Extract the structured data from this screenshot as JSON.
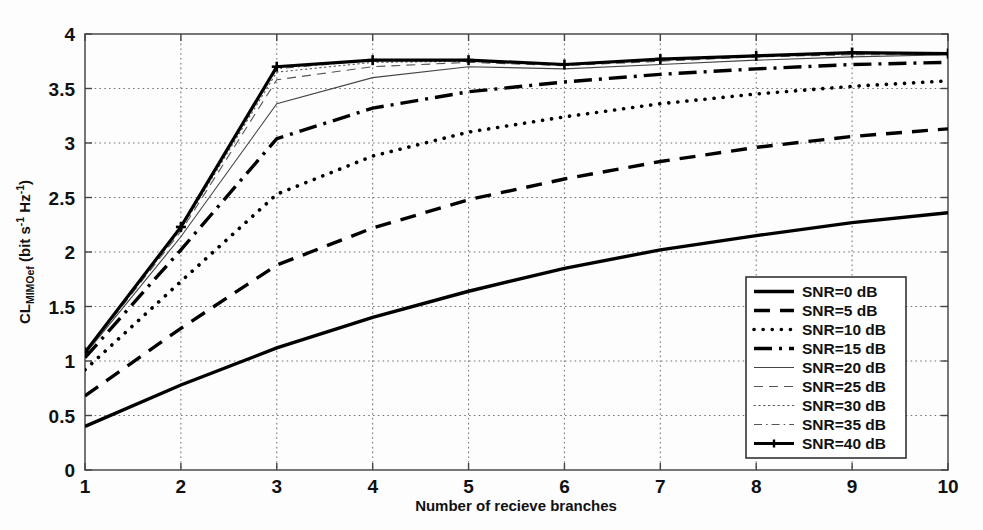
{
  "chart_data": {
    "type": "line",
    "title": "",
    "xlabel": "Number of recieve branches",
    "ylabel": "CL_MIMOef (bit s^-1 Hz^-1)",
    "ylabel_parts": {
      "main1": "CL",
      "sub1": "MIMOef",
      "main2": " (bit s",
      "sup1": "-1",
      "main3": " Hz",
      "sup2": "-1",
      "main4": ")"
    },
    "x": [
      1,
      2,
      3,
      4,
      5,
      6,
      7,
      8,
      9,
      10
    ],
    "xlim": [
      1,
      10
    ],
    "ylim": [
      0,
      4
    ],
    "xticks": [
      "1",
      "2",
      "3",
      "4",
      "5",
      "6",
      "7",
      "8",
      "9",
      "10"
    ],
    "yticks": [
      "0",
      "0.5",
      "1",
      "1.5",
      "2",
      "2.5",
      "3",
      "3.5",
      "4"
    ],
    "grid": true,
    "grid_style": "dotted",
    "legend_position": "lower-right",
    "series": [
      {
        "name": "SNR=0 dB",
        "label": "SNR=0 dB",
        "style": "solid",
        "width": 3.4,
        "marker": "none",
        "color": "#000000",
        "values": [
          0.4,
          0.78,
          1.12,
          1.4,
          1.64,
          1.85,
          2.02,
          2.15,
          2.27,
          2.36
        ]
      },
      {
        "name": "SNR=5 dB",
        "label": "SNR=5 dB",
        "style": "dashed",
        "width": 3.4,
        "marker": "none",
        "color": "#000000",
        "values": [
          0.68,
          1.3,
          1.88,
          2.22,
          2.48,
          2.67,
          2.83,
          2.96,
          3.06,
          3.13
        ]
      },
      {
        "name": "SNR=10 dB",
        "label": "SNR=10 dB",
        "style": "dotted",
        "width": 3.6,
        "marker": "none",
        "color": "#000000",
        "values": [
          0.92,
          1.73,
          2.53,
          2.88,
          3.1,
          3.24,
          3.36,
          3.45,
          3.52,
          3.57
        ]
      },
      {
        "name": "SNR=15 dB",
        "label": "SNR=15 dB",
        "style": "dashdot",
        "width": 3.4,
        "marker": "none",
        "color": "#000000",
        "values": [
          1.03,
          2.02,
          3.04,
          3.32,
          3.47,
          3.56,
          3.63,
          3.68,
          3.72,
          3.74
        ]
      },
      {
        "name": "SNR=20 dB",
        "label": "SNR=20 dB",
        "style": "solid",
        "width": 1.1,
        "marker": "none",
        "color": "#444444",
        "values": [
          1.06,
          2.14,
          3.36,
          3.6,
          3.7,
          3.68,
          3.72,
          3.76,
          3.79,
          3.81
        ]
      },
      {
        "name": "SNR=25 dB",
        "label": "SNR=25 dB",
        "style": "dashed-thin",
        "width": 1.1,
        "marker": "none",
        "color": "#555555",
        "values": [
          1.07,
          2.19,
          3.58,
          3.7,
          3.74,
          3.71,
          3.75,
          3.79,
          3.81,
          3.81
        ]
      },
      {
        "name": "SNR=30 dB",
        "label": "SNR=30 dB",
        "style": "dotted-thin",
        "width": 1.1,
        "marker": "none",
        "color": "#555555",
        "values": [
          1.07,
          2.21,
          3.65,
          3.74,
          3.75,
          3.72,
          3.76,
          3.8,
          3.82,
          3.82
        ]
      },
      {
        "name": "SNR=35 dB",
        "label": "SNR=35 dB",
        "style": "dashdot-thin",
        "width": 1.1,
        "marker": "none",
        "color": "#555555",
        "values": [
          1.08,
          2.22,
          3.68,
          3.76,
          3.76,
          3.72,
          3.77,
          3.8,
          3.82,
          3.82
        ]
      },
      {
        "name": "SNR=40 dB",
        "label": "SNR=40 dB",
        "style": "solid-marker",
        "width": 3.2,
        "marker": "plus",
        "color": "#000000",
        "values": [
          1.08,
          2.23,
          3.7,
          3.76,
          3.76,
          3.72,
          3.77,
          3.8,
          3.83,
          3.82
        ]
      }
    ]
  },
  "legend": {
    "items": [
      {
        "label": "SNR=0 dB"
      },
      {
        "label": "SNR=5 dB"
      },
      {
        "label": "SNR=10 dB"
      },
      {
        "label": "SNR=15 dB"
      },
      {
        "label": "SNR=20 dB"
      },
      {
        "label": "SNR=25 dB"
      },
      {
        "label": "SNR=30 dB"
      },
      {
        "label": "SNR=35 dB"
      },
      {
        "label": "SNR=40 dB"
      }
    ]
  },
  "colors": {
    "axis": "#555555",
    "grid": "#777777",
    "background": "#fdfdfd",
    "line": "#000000"
  }
}
